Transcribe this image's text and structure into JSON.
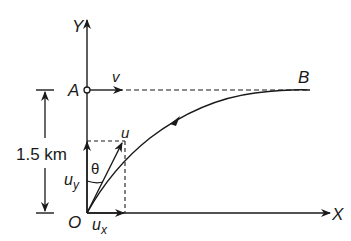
{
  "diagram": {
    "axes": {
      "y_label": "Y",
      "x_label": "X",
      "origin_label": "O"
    },
    "points": {
      "a_label": "A",
      "b_label": "B"
    },
    "vectors": {
      "v_label": "v",
      "u_label": "u",
      "uy_label": "u",
      "uy_sub": "y",
      "ux_label": "u",
      "ux_sub": "x",
      "theta_label": "θ"
    },
    "height_marker": {
      "label": "1.5 km"
    },
    "colors": {
      "ink": "#1a1a1a",
      "background": "#ffffff"
    }
  }
}
